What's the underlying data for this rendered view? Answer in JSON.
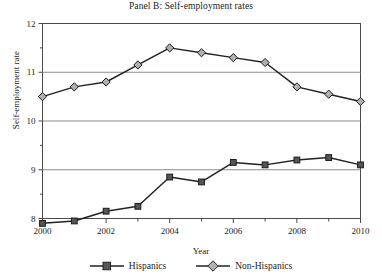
{
  "chart_data": {
    "type": "line",
    "title": "Panel B: Self-employment rates",
    "xlabel": "Year",
    "ylabel": "Self-employment rate",
    "x": [
      2000,
      2001,
      2002,
      2003,
      2004,
      2005,
      2006,
      2007,
      2008,
      2009,
      2010
    ],
    "xtick_labels": [
      "2000",
      "2002",
      "2004",
      "2006",
      "2008",
      "2010"
    ],
    "xtick_values": [
      2000,
      2002,
      2004,
      2006,
      2008,
      2010
    ],
    "xlim": [
      2000,
      2010
    ],
    "ytick_labels": [
      "8",
      "9",
      "10",
      "11",
      "12"
    ],
    "ytick_values": [
      8,
      9,
      10,
      11,
      12
    ],
    "ylim": [
      8,
      12
    ],
    "y_minor_ticks": [
      8.5,
      9.5,
      10.5,
      11.5
    ],
    "grid": "horizontal-major",
    "legend_position": "bottom-center",
    "series": [
      {
        "name": "Hispanics",
        "marker": "square",
        "marker_color": "#555555",
        "line_color": "#222222",
        "values": [
          7.9,
          7.95,
          8.15,
          8.25,
          8.85,
          8.75,
          9.15,
          9.1,
          9.2,
          9.25,
          9.1
        ]
      },
      {
        "name": "Non-Hispanics",
        "marker": "diamond",
        "marker_color": "#b0b0b0",
        "line_color": "#222222",
        "values": [
          10.5,
          10.7,
          10.8,
          11.15,
          11.5,
          11.4,
          11.3,
          11.2,
          10.7,
          10.55,
          10.4
        ]
      }
    ]
  },
  "legend": {
    "entries": [
      {
        "label": "Hispanics"
      },
      {
        "label": "Non-Hispanics"
      }
    ]
  },
  "colors": {
    "axis": "#4a4a4a",
    "gridline": "#8c8c8c",
    "line": "#222222",
    "hispanics_marker": "#555555",
    "nonhispanics_marker": "#b0b0b0",
    "background": "#ffffff"
  }
}
